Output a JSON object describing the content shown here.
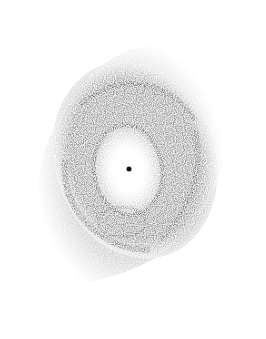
{
  "image": {
    "subject": "planetary nebula (inverted, stippled grayscale)",
    "background_color": "#ffffff",
    "ink_color": "#2a2a2a",
    "central_star": {
      "x": 129,
      "y": 169,
      "r": 2.5
    }
  }
}
